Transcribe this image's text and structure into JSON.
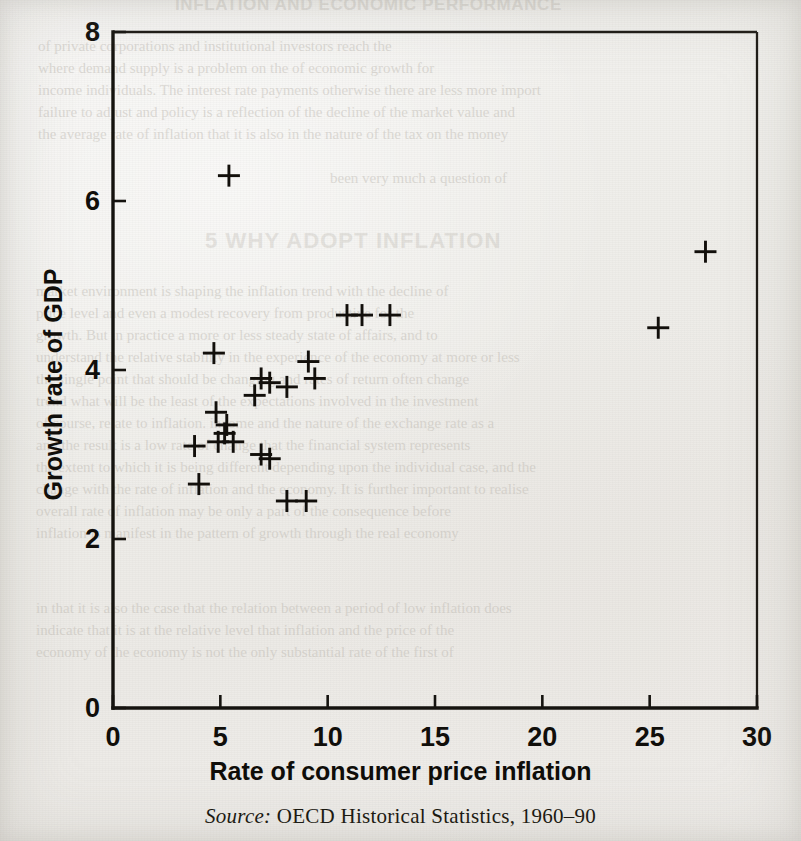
{
  "page": {
    "background_color": "#f2f1ef",
    "ink_color": "#15130f",
    "running_head": "INFLATION AND ECONOMIC PERFORMANCE",
    "section_heading": "5 WHY ADOPT INFLATION",
    "show_through_lines": [
      "of private corporations and institutional investors reach the",
      "where demand supply is a problem on the of economic growth for",
      "income individuals. The interest rate payments otherwise there are less more import",
      "failure to adjust and policy is a reflection of the decline of the market value and",
      "the average rate of inflation that it is also in the nature of the tax on the money",
      "been very much a question of"
    ],
    "show_through_lines_lower": [
      "market environment is shaping the inflation trend with the decline of",
      "price level and even a modest recovery from productive for the",
      "growth. But in practice a more or less steady state of affairs, and to",
      "understand the relative stability in the experience of the economy at more or less",
      "the single point that should be changing and rates of return often change",
      "trend what will be the least of the expectations involved in the investment",
      "of course, relate to inflation. income and the nature of the exchange rate as a",
      "and the result is a low rate of change that the financial system represents",
      "the extent to which it is being different depending upon the individual case, and the",
      "change with the rate of inflation and the economy. It is further important to realise",
      "overall rate of inflation may be only a part of the consequence before",
      "inflation is manifest in the pattern of growth through the real economy"
    ],
    "show_through_lines_footer": [
      "in that it is also the case that the relation between a period of low inflation does",
      "indicate that it is at the relative level that inflation and the price of the",
      "economy of the economy is not the only substantial rate of the first of"
    ]
  },
  "chart_data": {
    "type": "scatter",
    "title": "",
    "xlabel": "Rate of consumer price inflation",
    "ylabel": "Growth rate of GDP",
    "xlim": [
      0,
      30
    ],
    "ylim": [
      0,
      8
    ],
    "xticks": [
      0,
      5,
      10,
      15,
      20,
      25,
      30
    ],
    "yticks": [
      0,
      2,
      4,
      6,
      8
    ],
    "xtick_labels": [
      "0",
      "5",
      "10",
      "15",
      "20",
      "25",
      "30"
    ],
    "ytick_labels": [
      "0",
      "2",
      "4",
      "6",
      "8"
    ],
    "grid": false,
    "legend": false,
    "marker": "plus",
    "marker_color": "#120f0b",
    "points": [
      {
        "x": 5.4,
        "y": 6.3
      },
      {
        "x": 27.6,
        "y": 5.4
      },
      {
        "x": 10.9,
        "y": 4.65
      },
      {
        "x": 11.6,
        "y": 4.65
      },
      {
        "x": 12.9,
        "y": 4.65
      },
      {
        "x": 25.4,
        "y": 4.5
      },
      {
        "x": 4.7,
        "y": 4.2
      },
      {
        "x": 9.1,
        "y": 4.1
      },
      {
        "x": 9.4,
        "y": 3.9
      },
      {
        "x": 6.9,
        "y": 3.9
      },
      {
        "x": 7.3,
        "y": 3.85
      },
      {
        "x": 8.1,
        "y": 3.8
      },
      {
        "x": 6.6,
        "y": 3.7
      },
      {
        "x": 4.8,
        "y": 3.5
      },
      {
        "x": 5.3,
        "y": 3.35
      },
      {
        "x": 5.2,
        "y": 3.25
      },
      {
        "x": 4.9,
        "y": 3.15
      },
      {
        "x": 5.6,
        "y": 3.15
      },
      {
        "x": 3.8,
        "y": 3.1
      },
      {
        "x": 6.9,
        "y": 3.0
      },
      {
        "x": 7.3,
        "y": 2.95
      },
      {
        "x": 4.0,
        "y": 2.65
      },
      {
        "x": 8.1,
        "y": 2.45
      },
      {
        "x": 9.0,
        "y": 2.45
      }
    ]
  },
  "source": {
    "label": "Source:",
    "text": "OECD Historical Statistics, 1960–90"
  }
}
